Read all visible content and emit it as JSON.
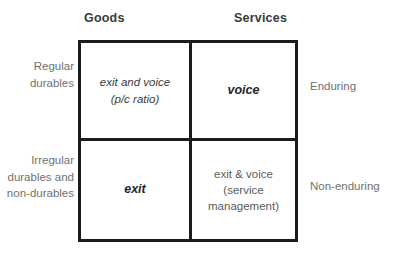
{
  "diagram": {
    "type": "2x2-matrix",
    "columns": [
      {
        "key": "goods",
        "label": "Goods"
      },
      {
        "key": "services",
        "label": "Services"
      }
    ],
    "rows": [
      {
        "key": "regular",
        "left_label": "Regular\ndurables",
        "right_label": "Enduring"
      },
      {
        "key": "irregular",
        "left_label": "Irregular\ndurables and\nnon-durables",
        "right_label": "Non-enduring"
      }
    ],
    "cells": {
      "goods_regular": {
        "text": "exit and voice\n(p/c ratio)",
        "style": "italic"
      },
      "services_regular": {
        "text": "voice",
        "style": "bold-italic"
      },
      "goods_irregular": {
        "text": "exit",
        "style": "bold-italic"
      },
      "services_irregular": {
        "text": "exit & voice\n(service\nmanagement)",
        "style": "plain"
      }
    },
    "colors": {
      "border": "#1b1b1b",
      "background": "#ffffff",
      "header_text": "#3a3a3a",
      "side_label_text": "#707070",
      "cell_text": "#3c3c3c"
    }
  }
}
